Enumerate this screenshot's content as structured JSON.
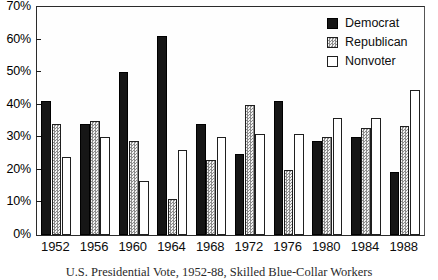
{
  "chart_data": {
    "type": "bar",
    "title": "",
    "caption": "U.S. Presidential Vote, 1952-88, Skilled Blue-Collar Workers",
    "xlabel": "",
    "ylabel": "",
    "ylim": [
      0,
      70
    ],
    "ytick_labels": [
      "0%",
      "10%",
      "20%",
      "30%",
      "40%",
      "50%",
      "60%",
      "70%"
    ],
    "ytick_values": [
      0,
      10,
      20,
      30,
      40,
      50,
      60,
      70
    ],
    "grid": false,
    "legend_position": "top-right",
    "categories": [
      "1952",
      "1956",
      "1960",
      "1964",
      "1968",
      "1972",
      "1976",
      "1980",
      "1984",
      "1988"
    ],
    "series": [
      {
        "name": "Democrat",
        "color": "#161616",
        "pattern": "solid",
        "values": [
          41,
          34,
          50,
          61,
          34,
          25,
          41,
          29,
          30,
          19.5
        ]
      },
      {
        "name": "Republican",
        "color": "#e6e6e6",
        "pattern": "dotted",
        "values": [
          34,
          35,
          29,
          11,
          23,
          40,
          20,
          30,
          33,
          33.5
        ]
      },
      {
        "name": "Nonvoter",
        "color": "#ffffff",
        "pattern": "outline",
        "values": [
          24,
          30,
          16.5,
          26,
          30,
          31,
          31,
          36,
          36,
          44.5
        ]
      }
    ]
  },
  "legend": {
    "items": [
      {
        "label": "Democrat",
        "swatch": "swatch-democrat"
      },
      {
        "label": "Republican",
        "swatch": "swatch-republican"
      },
      {
        "label": "Nonvoter",
        "swatch": "swatch-nonvoter"
      }
    ]
  }
}
